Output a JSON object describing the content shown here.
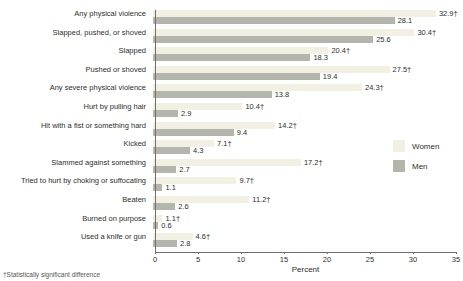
{
  "chart_data": {
    "type": "bar",
    "orientation": "horizontal",
    "title": "",
    "categories": [
      "Any physical violence",
      "Slapped, pushed, or shoved",
      "Slapped",
      "Pushed or shoved",
      "Any severe physical violence",
      "Hurt by pulling hair",
      "Hit with a fist or something hard",
      "Kicked",
      "Slammed against something",
      "Tried to hurt by choking or suffocating",
      "Beaten",
      "Burned on purpose",
      "Used a knife or gun"
    ],
    "series": [
      {
        "name": "Women",
        "color": "#f1f0e3",
        "values": [
          32.9,
          30.4,
          20.4,
          27.5,
          24.3,
          10.4,
          14.2,
          7.1,
          17.2,
          9.7,
          11.2,
          1.1,
          4.6
        ],
        "labels": [
          "32.9†",
          "30.4†",
          "20.4†",
          "27.5†",
          "24.3†",
          "10.4†",
          "14.2†",
          "7.1†",
          "17.2†",
          "9.7†",
          "11.2†",
          "1.1†",
          "4.6†"
        ]
      },
      {
        "name": "Men",
        "color": "#b4b6ae",
        "values": [
          28.1,
          25.6,
          18.3,
          19.4,
          13.8,
          2.9,
          9.4,
          4.3,
          2.7,
          1.1,
          2.6,
          0.6,
          2.8
        ],
        "labels": [
          "28.1",
          "25.6",
          "18.3",
          "19.4",
          "13.8",
          "2.9",
          "9.4",
          "4.3",
          "2.7",
          "1.1",
          "2.6",
          "0.6",
          "2.8"
        ]
      }
    ],
    "xlabel": "Percent",
    "xlim": [
      0,
      35
    ],
    "xticks": [
      0,
      5,
      10,
      15,
      20,
      25,
      30,
      35
    ],
    "grid": false,
    "legend_position": "right-middle",
    "footnote": "†Statistically significant difference"
  }
}
